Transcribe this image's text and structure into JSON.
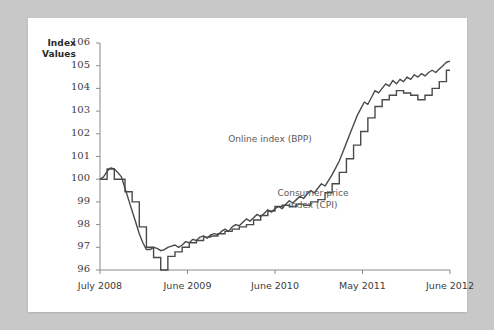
{
  "figure": {
    "background_color": "#c8c8c8",
    "card_color": "#ffffff",
    "line_color": "#4a4a4a"
  },
  "axis": {
    "y_title": "Index\nValues",
    "y_title_line1": "Index",
    "y_title_line2": "Values"
  },
  "annotations": {
    "bpp": "Online index (BPP)",
    "cpi": "Consumer price\nindex (CPI)"
  },
  "chart_data": {
    "type": "line",
    "title": "",
    "xlabel": "",
    "ylabel": "Index Values",
    "ylim": [
      96,
      106
    ],
    "yticks": [
      96,
      97,
      98,
      99,
      100,
      101,
      102,
      103,
      104,
      105,
      106
    ],
    "xticks": [
      "July 2008",
      "June 2009",
      "June 2010",
      "May 2011",
      "June 2012"
    ],
    "xtick_positions": [
      0,
      0.25,
      0.5,
      0.75,
      1.0
    ],
    "grid": false,
    "legend": "inline-annotations",
    "series": [
      {
        "name": "Online index (BPP)",
        "style": "noisy-line",
        "values": [
          100.0,
          100.1,
          100.35,
          100.5,
          100.45,
          100.3,
          100.1,
          99.6,
          99.1,
          98.6,
          98.1,
          97.6,
          97.2,
          96.9,
          96.9,
          97.0,
          96.95,
          96.85,
          96.9,
          97.0,
          97.05,
          97.1,
          97.0,
          97.1,
          97.25,
          97.2,
          97.35,
          97.3,
          97.45,
          97.5,
          97.4,
          97.55,
          97.6,
          97.55,
          97.7,
          97.8,
          97.7,
          97.9,
          98.0,
          97.95,
          98.1,
          98.25,
          98.15,
          98.3,
          98.45,
          98.35,
          98.5,
          98.65,
          98.55,
          98.7,
          98.8,
          98.7,
          98.9,
          99.05,
          98.95,
          99.1,
          99.25,
          99.15,
          99.35,
          99.5,
          99.4,
          99.6,
          99.8,
          99.7,
          99.95,
          100.2,
          100.5,
          100.8,
          101.2,
          101.6,
          102.0,
          102.4,
          102.8,
          103.1,
          103.4,
          103.3,
          103.6,
          103.9,
          103.8,
          104.0,
          104.2,
          104.1,
          104.35,
          104.2,
          104.4,
          104.3,
          104.5,
          104.4,
          104.6,
          104.5,
          104.65,
          104.55,
          104.7,
          104.8,
          104.7,
          104.85,
          105.0,
          105.15,
          105.2
        ]
      },
      {
        "name": "Consumer price index (CPI)",
        "style": "stepped-line",
        "values": [
          100.0,
          100.0,
          100.45,
          100.45,
          100.0,
          100.0,
          100.0,
          99.45,
          99.45,
          99.0,
          99.0,
          97.9,
          97.9,
          97.0,
          97.0,
          96.55,
          96.55,
          96.0,
          96.0,
          96.6,
          96.6,
          96.8,
          96.8,
          97.0,
          97.0,
          97.2,
          97.2,
          97.3,
          97.3,
          97.45,
          97.45,
          97.5,
          97.5,
          97.6,
          97.6,
          97.7,
          97.7,
          97.8,
          97.8,
          97.9,
          97.9,
          98.0,
          98.0,
          98.2,
          98.2,
          98.4,
          98.4,
          98.6,
          98.6,
          98.8,
          98.8,
          98.85,
          98.85,
          98.8,
          98.8,
          98.9,
          98.9,
          98.85,
          98.85,
          99.0,
          99.0,
          99.1,
          99.1,
          99.4,
          99.4,
          99.8,
          99.8,
          100.3,
          100.3,
          100.9,
          100.9,
          101.5,
          101.5,
          102.1,
          102.1,
          102.7,
          102.7,
          103.2,
          103.2,
          103.5,
          103.5,
          103.7,
          103.7,
          103.9,
          103.9,
          103.8,
          103.8,
          103.7,
          103.7,
          103.5,
          103.5,
          103.7,
          103.7,
          104.0,
          104.0,
          104.3,
          104.3,
          104.8,
          104.8
        ]
      }
    ]
  }
}
